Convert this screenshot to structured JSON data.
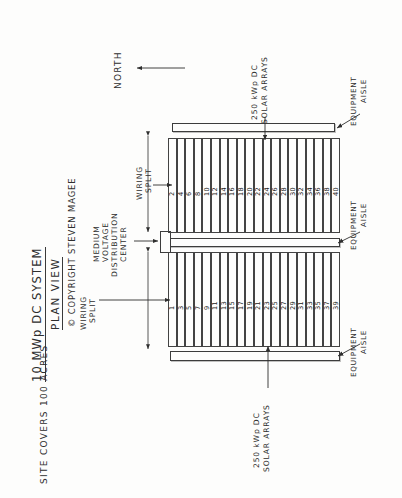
{
  "sheet": {
    "title": "10 MWp DC SYSTEM",
    "subtitle": "PLAN VIEW",
    "copyright": "© COPYRIGHT STEVEN MAGEE",
    "site_note": "SITE COVERS 100 ACRES",
    "north_label": "NORTH",
    "ink_color": "#2e2e2e",
    "paper_color": "#fdfdfc"
  },
  "callouts": {
    "array_top": "250 kWp DC\nSOLAR ARRAYS",
    "array_top_line1": "250 kWp DC",
    "array_top_line2": "SOLAR ARRAYS",
    "array_bottom_line1": "250 kWp DC",
    "array_bottom_line2": "SOLAR ARRAYS",
    "mvdc_line1": "MEDIUM",
    "mvdc_line2": "VOLTAGE",
    "mvdc_line3": "DISTRIBUTION",
    "mvdc_line4": "CENTER",
    "equipment_aisle_line1": "EQUIPMENT",
    "equipment_aisle_line2": "AISLE",
    "wiring_split_line1": "WIRING",
    "wiring_split_line2": "SPLIT"
  },
  "equipment_aisles": [
    {
      "name": "equipment-aisle-north"
    },
    {
      "name": "equipment-aisle-middle"
    },
    {
      "name": "equipment-aisle-south"
    }
  ],
  "wiring_splits": [
    {
      "name": "wiring-split-north"
    },
    {
      "name": "wiring-split-south"
    }
  ],
  "array_blocks": [
    {
      "name": "array-block-even",
      "count": 20,
      "numbers": [
        2,
        4,
        6,
        8,
        10,
        12,
        14,
        16,
        18,
        20,
        22,
        24,
        26,
        28,
        30,
        32,
        34,
        36,
        38,
        40
      ]
    },
    {
      "name": "array-block-odd",
      "count": 20,
      "numbers": [
        1,
        3,
        5,
        7,
        9,
        11,
        13,
        15,
        17,
        19,
        21,
        23,
        25,
        27,
        29,
        31,
        33,
        35,
        37,
        39
      ]
    }
  ],
  "totals": {
    "array_rating": "250 kWp DC",
    "array_count": 40,
    "system_rating": "10 MWp DC",
    "site_area": "100 ACRES"
  }
}
